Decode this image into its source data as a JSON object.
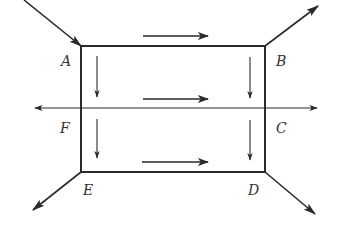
{
  "diagram": {
    "colors": {
      "stroke": "#2a2a2a",
      "label": "#333333",
      "background": "#ffffff"
    },
    "points": {
      "A": {
        "label": "A",
        "x": 81,
        "y": 46
      },
      "B": {
        "label": "B",
        "x": 265,
        "y": 46
      },
      "C": {
        "label": "C",
        "x": 265,
        "y": 108
      },
      "D": {
        "label": "D",
        "x": 265,
        "y": 172
      },
      "E": {
        "label": "E",
        "x": 81,
        "y": 172
      },
      "F": {
        "label": "F",
        "x": 81,
        "y": 108
      }
    },
    "labels": {
      "A": "A",
      "B": "B",
      "C": "C",
      "D": "D",
      "E": "E",
      "F": "F"
    },
    "external_lines": [
      {
        "name": "incoming-to-A",
        "from": [
          24,
          0
        ],
        "to": [
          81,
          46
        ],
        "arrow_at": "end"
      },
      {
        "name": "outgoing-from-B",
        "from": [
          265,
          46
        ],
        "to": [
          318,
          6
        ],
        "arrow_at": "end"
      },
      {
        "name": "outgoing-from-E",
        "from": [
          81,
          172
        ],
        "to": [
          33,
          210
        ],
        "arrow_at": "end"
      },
      {
        "name": "outgoing-from-D",
        "from": [
          265,
          172
        ],
        "to": [
          315,
          214
        ],
        "arrow_at": "end"
      },
      {
        "name": "axis-left",
        "from": [
          81,
          108
        ],
        "to": [
          35,
          108
        ],
        "arrow_at": "end"
      },
      {
        "name": "axis-right",
        "from": [
          265,
          108
        ],
        "to": [
          317,
          108
        ],
        "arrow_at": "end"
      }
    ],
    "inner_arrows": [
      {
        "name": "top-right-arrow",
        "from": [
          143,
          36
        ],
        "to": [
          208,
          36
        ],
        "direction": "right"
      },
      {
        "name": "middle-right-arrow",
        "from": [
          143,
          99
        ],
        "to": [
          208,
          99
        ],
        "direction": "right"
      },
      {
        "name": "bottom-right-arrow",
        "from": [
          142,
          162
        ],
        "to": [
          208,
          162
        ],
        "direction": "right"
      },
      {
        "name": "left-upper-down-arrow",
        "from": [
          97,
          56
        ],
        "to": [
          97,
          97
        ],
        "direction": "down"
      },
      {
        "name": "left-lower-down-arrow",
        "from": [
          97,
          119
        ],
        "to": [
          97,
          158
        ],
        "direction": "down"
      },
      {
        "name": "right-upper-down-arrow",
        "from": [
          250,
          57
        ],
        "to": [
          250,
          98
        ],
        "direction": "down"
      },
      {
        "name": "right-lower-down-arrow",
        "from": [
          250,
          120
        ],
        "to": [
          250,
          160
        ],
        "direction": "down"
      }
    ]
  }
}
